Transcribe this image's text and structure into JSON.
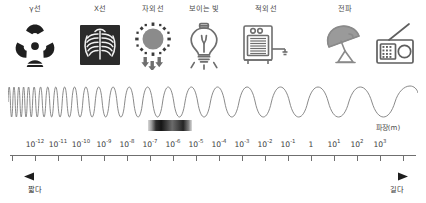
{
  "diagram": {
    "axis": {
      "title": "파장(m)",
      "tick_labels": [
        {
          "mantissa": "10",
          "exponent": "-12",
          "x": 35
        },
        {
          "mantissa": "10",
          "exponent": "-11",
          "x": 70
        },
        {
          "mantissa": "10",
          "exponent": "-10",
          "x": 105
        },
        {
          "mantissa": "10",
          "exponent": "-9",
          "x": 139
        },
        {
          "mantissa": "10",
          "exponent": "-8",
          "x": 173
        },
        {
          "mantissa": "10",
          "exponent": "-7",
          "x": 207
        },
        {
          "mantissa": "10",
          "exponent": "-6",
          "x": 241
        },
        {
          "mantissa": "10",
          "exponent": "-5",
          "x": 275
        },
        {
          "mantissa": "10",
          "exponent": "-4",
          "x": 303
        },
        {
          "mantissa": "10",
          "exponent": "-3",
          "x": 331
        },
        {
          "mantissa": "10",
          "exponent": "-2",
          "x": 359
        },
        {
          "mantissa": "10",
          "exponent": "-1",
          "x": 387
        },
        {
          "mantissa": "1",
          "exponent": "",
          "x": 409
        },
        {
          "mantissa": "10",
          "exponent": "1",
          "x": 435
        },
        {
          "mantissa": "10",
          "exponent": "2",
          "x": 463
        },
        {
          "mantissa": "10",
          "exponent": "3",
          "x": 491
        }
      ]
    },
    "bands": [
      {
        "label": "γ선",
        "icon": "radiation-trefoil-icon",
        "x": 35
      },
      {
        "label": "X선",
        "icon": "chest-xray-icon",
        "x": 100
      },
      {
        "label": "자외선",
        "icon": "uv-sun-icon",
        "x": 153
      },
      {
        "label": "보이는 빛",
        "icon": "light-bulb-icon",
        "x": 204
      },
      {
        "label": "적외선",
        "icon": "heater-icon",
        "x": 266
      },
      {
        "label": "전파",
        "icon": "satellite-dish-icon",
        "x": 345
      },
      {
        "label": "",
        "icon": "radio-icon",
        "x": 396
      }
    ],
    "scale_notes": {
      "short_label": "짧다",
      "long_label": "길다"
    },
    "visible_light_bar": {
      "name": "visible-spectrum-gradient"
    },
    "colors": {
      "ink": "#3a3a3a",
      "axis": "#6f6f6f",
      "wave": "#7a7a7a",
      "icon": "#6e6e6e",
      "icon_dark": "#2c2c2c"
    }
  }
}
